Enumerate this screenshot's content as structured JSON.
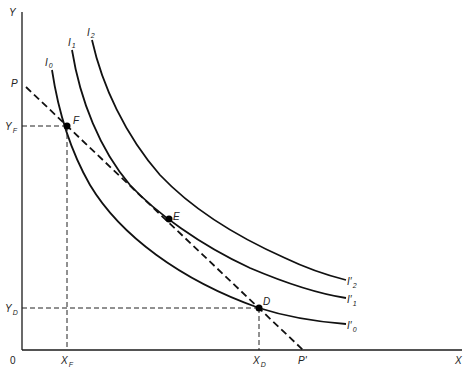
{
  "diagram": {
    "type": "indifference-curve-diagram",
    "axes": {
      "origin_label": "0",
      "x_label": "X",
      "y_label": "Y"
    },
    "budget_line": {
      "start_label": "P",
      "end_label": "P'",
      "end_label_main": "P",
      "end_label_prime": "′"
    },
    "curves": [
      {
        "top_label_main": "I",
        "top_label_sub": "0",
        "end_label_main": "I′",
        "end_label_sub": "0"
      },
      {
        "top_label_main": "I",
        "top_label_sub": "1",
        "end_label_main": "I′",
        "end_label_sub": "1"
      },
      {
        "top_label_main": "I",
        "top_label_sub": "2",
        "end_label_main": "I′",
        "end_label_sub": "2"
      }
    ],
    "points": {
      "F": {
        "label": "F",
        "x_tick_main": "X",
        "x_tick_sub": "F",
        "y_tick_main": "Y",
        "y_tick_sub": "F"
      },
      "E": {
        "label": "E"
      },
      "D": {
        "label": "D",
        "x_tick_main": "X",
        "x_tick_sub": "D",
        "y_tick_main": "Y",
        "y_tick_sub": "D"
      }
    }
  }
}
